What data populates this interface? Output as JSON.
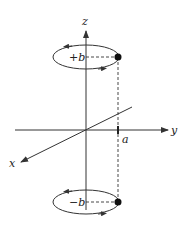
{
  "diagram": {
    "axes": {
      "x_label": "x",
      "y_label": "y",
      "z_label": "z"
    },
    "markers": {
      "y_tick_label": "a"
    },
    "loops": [
      {
        "id": "upper",
        "label": "+b"
      },
      {
        "id": "lower",
        "label": "−b"
      }
    ],
    "colors": {
      "line": "#333333",
      "background": "#ffffff"
    }
  }
}
